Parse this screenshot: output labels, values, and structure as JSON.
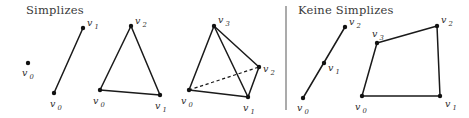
{
  "figure": {
    "width": 469,
    "height": 118,
    "background": "#ffffff",
    "ink": "#1a1a1a",
    "divider_color": "#666666"
  },
  "panels": [
    {
      "id": "simplizes",
      "title": "Simplizes",
      "title_pos": {
        "x": 26,
        "y": 14
      },
      "figures": [
        {
          "id": "point-0-simplex",
          "kind": "point",
          "vertices": [
            {
              "name": "v0",
              "label": "v",
              "sub": "0",
              "x": 28,
              "y": 63,
              "label_x": 22,
              "label_y": 76,
              "sub_x": 29.5,
              "sub_y": 78.5
            }
          ],
          "edges": [],
          "dashed_edges": []
        },
        {
          "id": "segment-1-simplex",
          "kind": "segment",
          "vertices": [
            {
              "name": "v0",
              "label": "v",
              "sub": "0",
              "x": 54,
              "y": 93,
              "label_x": 50,
              "label_y": 107,
              "sub_x": 57.5,
              "sub_y": 109.5
            },
            {
              "name": "v1",
              "label": "v",
              "sub": "1",
              "x": 83,
              "y": 28,
              "label_x": 87,
              "label_y": 26,
              "sub_x": 94.5,
              "sub_y": 28.5
            }
          ],
          "edges": [
            [
              "v0",
              "v1"
            ]
          ],
          "dashed_edges": []
        },
        {
          "id": "triangle-2-simplex",
          "kind": "triangle",
          "vertices": [
            {
              "name": "v0",
              "label": "v",
              "sub": "0",
              "x": 100,
              "y": 90,
              "label_x": 93,
              "label_y": 104,
              "sub_x": 100.5,
              "sub_y": 106.5
            },
            {
              "name": "v1",
              "label": "v",
              "sub": "1",
              "x": 160,
              "y": 95,
              "label_x": 155,
              "label_y": 109,
              "sub_x": 162.5,
              "sub_y": 111.5
            },
            {
              "name": "v2",
              "label": "v",
              "sub": "2",
              "x": 131,
              "y": 26,
              "label_x": 135,
              "label_y": 24,
              "sub_x": 142.5,
              "sub_y": 26.5
            }
          ],
          "edges": [
            [
              "v0",
              "v1"
            ],
            [
              "v1",
              "v2"
            ],
            [
              "v2",
              "v0"
            ]
          ],
          "dashed_edges": []
        },
        {
          "id": "tetrahedron-3-simplex",
          "kind": "tetrahedron",
          "vertices": [
            {
              "name": "v0",
              "label": "v",
              "sub": "0",
              "x": 189,
              "y": 90,
              "label_x": 181,
              "label_y": 104,
              "sub_x": 188.5,
              "sub_y": 106.5
            },
            {
              "name": "v1",
              "label": "v",
              "sub": "1",
              "x": 248,
              "y": 97,
              "label_x": 243,
              "label_y": 111,
              "sub_x": 250.5,
              "sub_y": 113.5
            },
            {
              "name": "v2",
              "label": "v",
              "sub": "2",
              "x": 259,
              "y": 67,
              "label_x": 263,
              "label_y": 72,
              "sub_x": 270.5,
              "sub_y": 74.5
            },
            {
              "name": "v3",
              "label": "v",
              "sub": "3",
              "x": 214,
              "y": 26,
              "label_x": 218,
              "label_y": 23,
              "sub_x": 225.5,
              "sub_y": 25.5
            }
          ],
          "edges": [
            [
              "v0",
              "v1"
            ],
            [
              "v1",
              "v2"
            ],
            [
              "v0",
              "v3"
            ],
            [
              "v1",
              "v3"
            ],
            [
              "v2",
              "v3"
            ]
          ],
          "dashed_edges": [
            [
              "v0",
              "v2"
            ]
          ]
        }
      ]
    },
    {
      "id": "keine-simplizes",
      "title": "Keine Simplizes",
      "title_pos": {
        "x": 298,
        "y": 14
      },
      "figures": [
        {
          "id": "degenerate-collinear-segment",
          "kind": "collinear-segment",
          "vertices": [
            {
              "name": "v0",
              "label": "v",
              "sub": "0",
              "x": 303,
              "y": 98,
              "label_x": 297,
              "label_y": 111,
              "sub_x": 304.5,
              "sub_y": 113.5
            },
            {
              "name": "v1",
              "label": "v",
              "sub": "1",
              "x": 324,
              "y": 63,
              "label_x": 328,
              "label_y": 71,
              "sub_x": 335.5,
              "sub_y": 73.5
            },
            {
              "name": "v2",
              "label": "v",
              "sub": "2",
              "x": 345,
              "y": 27,
              "label_x": 349,
              "label_y": 25,
              "sub_x": 356.5,
              "sub_y": 27.5
            }
          ],
          "edges": [
            [
              "v0",
              "v2"
            ]
          ],
          "dashed_edges": []
        },
        {
          "id": "quadrilateral",
          "kind": "quadrilateral",
          "vertices": [
            {
              "name": "v0",
              "label": "v",
              "sub": "0",
              "x": 362,
              "y": 96,
              "label_x": 355,
              "label_y": 110,
              "sub_x": 362.5,
              "sub_y": 112.5
            },
            {
              "name": "v1",
              "label": "v",
              "sub": "1",
              "x": 440,
              "y": 96,
              "label_x": 445,
              "label_y": 107,
              "sub_x": 452.5,
              "sub_y": 109.5
            },
            {
              "name": "v2",
              "label": "v",
              "sub": "2",
              "x": 437,
              "y": 26,
              "label_x": 441,
              "label_y": 23,
              "sub_x": 448.5,
              "sub_y": 25.5
            },
            {
              "name": "v3",
              "label": "v",
              "sub": "3",
              "x": 377,
              "y": 43,
              "label_x": 372,
              "label_y": 37,
              "sub_x": 379.5,
              "sub_y": 39.5
            }
          ],
          "edges": [
            [
              "v0",
              "v1"
            ],
            [
              "v1",
              "v2"
            ],
            [
              "v2",
              "v3"
            ],
            [
              "v3",
              "v0"
            ]
          ],
          "dashed_edges": []
        }
      ]
    }
  ],
  "divider": {
    "x": 286,
    "y1": 6,
    "y2": 110
  }
}
